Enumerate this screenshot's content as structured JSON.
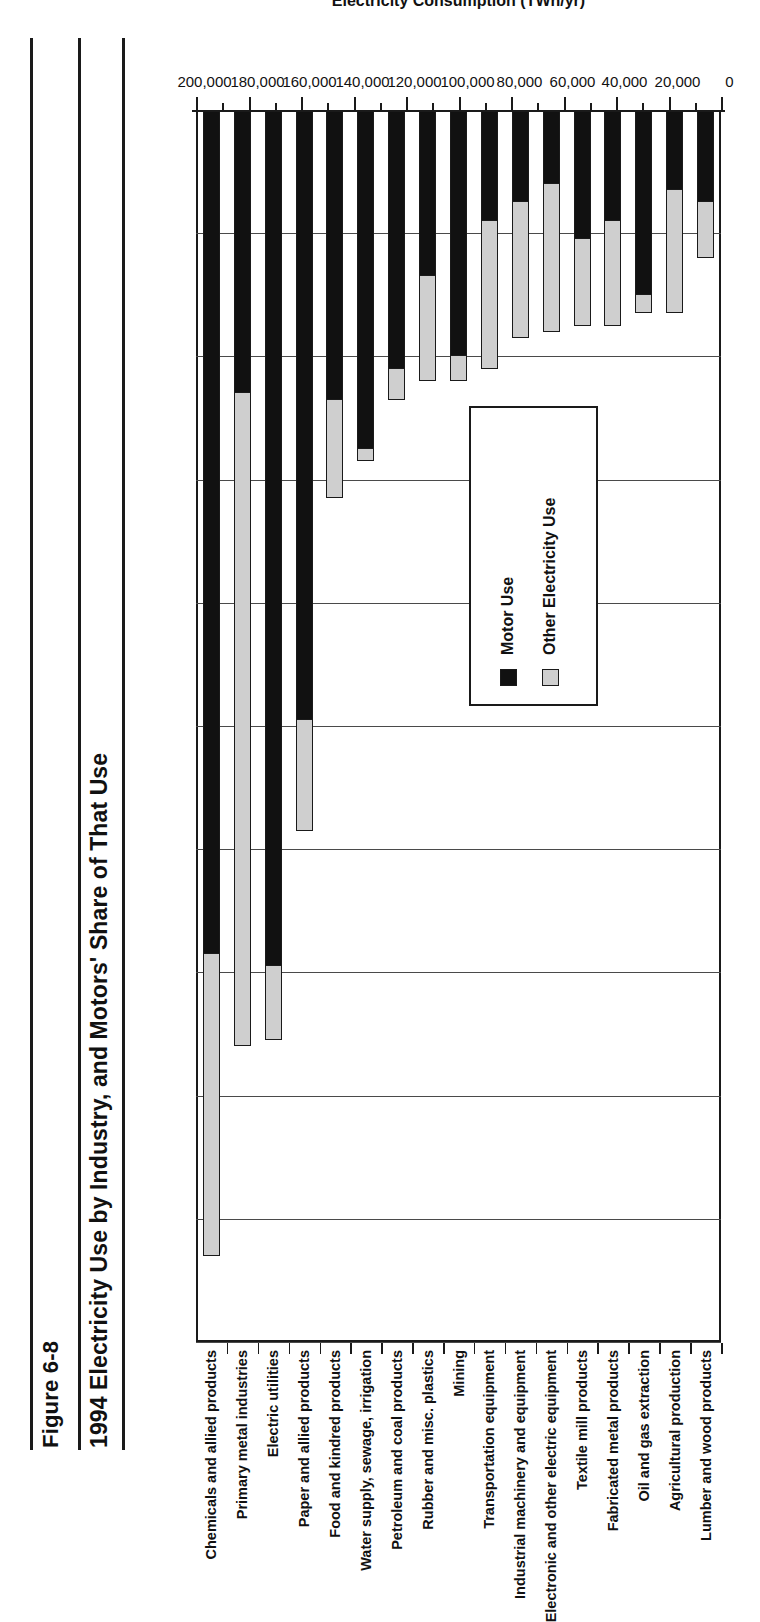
{
  "figure": {
    "number": "Figure 6-8",
    "title": "1994 Electricity Use by Industry, and Motors' Share of That Use"
  },
  "legend": {
    "position": "inside-right",
    "items": [
      {
        "label": "Motor Use",
        "swatch": "black-square-icon",
        "color": "#111111"
      },
      {
        "label": "Other Electricity Use",
        "swatch": "gray-square-icon",
        "color": "#cfcfcf"
      }
    ]
  },
  "chart_data": {
    "type": "bar",
    "orientation": "horizontal-stacked",
    "title": "1994 Electricity Use by Industry, and Motors' Share of That Use",
    "xlabel": "Electricity Consumption (TWh/yr)",
    "ylabel": "",
    "xlim": [
      0,
      200000
    ],
    "xticks": [
      0,
      20000,
      40000,
      60000,
      80000,
      100000,
      120000,
      140000,
      160000,
      180000,
      200000
    ],
    "xticklabels": [
      "0",
      "20,000",
      "40,000",
      "60,000",
      "80,000",
      "100,000",
      "120,000",
      "140,000",
      "160,000",
      "180,000",
      "200,000"
    ],
    "minor_tick_interval": 10000,
    "grid": true,
    "categories": [
      "Chemicals and allied products",
      "Primary metal industries",
      "Electric utilities",
      "Paper and allied products",
      "Food and kindred products",
      "Water supply, sewage, irrigation",
      "Petroleum and coal products",
      "Rubber and misc. plastics",
      "Mining",
      "Transportation equipment",
      "Industrial machinery and equipment",
      "Electronic and other electric equipment",
      "Textile mill products",
      "Fabricated metal products",
      "Oil and gas extraction",
      "Agricultural production",
      "Lumber and wood products"
    ],
    "series": [
      {
        "name": "Motor Use",
        "color": "#111111",
        "values": [
          137000,
          46000,
          139000,
          99000,
          47000,
          55000,
          42000,
          27000,
          40000,
          18000,
          15000,
          12000,
          21000,
          18000,
          30000,
          13000,
          15000
        ]
      },
      {
        "name": "Other Electricity Use",
        "color": "#cfcfcf",
        "values": [
          49000,
          106000,
          12000,
          18000,
          16000,
          2000,
          5000,
          17000,
          4000,
          24000,
          22000,
          24000,
          14000,
          17000,
          3000,
          20000,
          9000
        ]
      }
    ],
    "totals": [
      186000,
      152000,
      151000,
      117000,
      63000,
      57000,
      47000,
      44000,
      44000,
      42000,
      37000,
      36000,
      35000,
      35000,
      33000,
      33000,
      24000
    ]
  }
}
